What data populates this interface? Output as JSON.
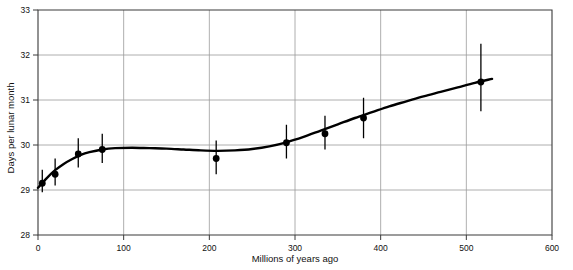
{
  "chart_data": {
    "type": "scatter",
    "title": "",
    "xlabel": "Millions of years ago",
    "ylabel": "Days per lunar month",
    "xlim": [
      0,
      600
    ],
    "ylim": [
      28,
      33
    ],
    "xticks": [
      0,
      100,
      200,
      300,
      400,
      500,
      600
    ],
    "xticklabels": [
      "0",
      "100",
      "200",
      "300",
      "400",
      "500",
      "600"
    ],
    "yticks": [
      28,
      29,
      30,
      31,
      32,
      33
    ],
    "yticklabels": [
      "28",
      "29",
      "30",
      "31",
      "32",
      "33"
    ],
    "grid": true,
    "legend": false,
    "series": [
      {
        "name": "Measured days per lunar month",
        "marker": "filled-circle",
        "color": "#000000",
        "points": [
          {
            "x": 5,
            "y": 29.15,
            "yerr_low": 28.95,
            "yerr_high": 29.45
          },
          {
            "x": 20,
            "y": 29.35,
            "yerr_low": 29.1,
            "yerr_high": 29.7
          },
          {
            "x": 47,
            "y": 29.8,
            "yerr_low": 29.5,
            "yerr_high": 30.15
          },
          {
            "x": 75,
            "y": 29.9,
            "yerr_low": 29.6,
            "yerr_high": 30.25
          },
          {
            "x": 208,
            "y": 29.7,
            "yerr_low": 29.35,
            "yerr_high": 30.1
          },
          {
            "x": 290,
            "y": 30.05,
            "yerr_low": 29.7,
            "yerr_high": 30.45
          },
          {
            "x": 335,
            "y": 30.25,
            "yerr_low": 29.9,
            "yerr_high": 30.65
          },
          {
            "x": 380,
            "y": 30.6,
            "yerr_low": 30.15,
            "yerr_high": 31.05
          },
          {
            "x": 517,
            "y": 31.4,
            "yerr_low": 30.75,
            "yerr_high": 32.25
          }
        ]
      },
      {
        "name": "Fitted trend curve",
        "type": "line",
        "color": "#000000",
        "x": [
          0,
          10,
          20,
          30,
          40,
          50,
          60,
          75,
          90,
          110,
          130,
          150,
          170,
          190,
          210,
          230,
          250,
          270,
          290,
          310,
          330,
          350,
          370,
          390,
          410,
          430,
          450,
          470,
          490,
          510,
          530
        ],
        "y": [
          29.05,
          29.26,
          29.44,
          29.58,
          29.69,
          29.78,
          29.84,
          29.9,
          29.93,
          29.94,
          29.93,
          29.92,
          29.9,
          29.88,
          29.87,
          29.88,
          29.91,
          29.97,
          30.06,
          30.18,
          30.32,
          30.46,
          30.6,
          30.73,
          30.86,
          30.97,
          31.08,
          31.18,
          31.28,
          31.38,
          31.47
        ]
      }
    ]
  }
}
